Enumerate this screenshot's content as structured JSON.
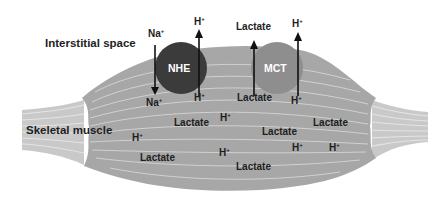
{
  "diagram": {
    "title_regions": {
      "interstitial": "Interstitial space",
      "muscle": "Skeletal muscle"
    },
    "transporters": [
      {
        "id": "nhe",
        "label": "NHE",
        "color": "#3b3b3b",
        "in_label": "Na",
        "in_sup": "+",
        "out_label": "H",
        "out_sup": "+",
        "direction": "Na+ into cell, H+ out of cell"
      },
      {
        "id": "mct",
        "label": "MCT",
        "color": "#8e8e8e",
        "out1_label": "Lactate",
        "out2_label": "H",
        "out2_sup": "+",
        "direction": "Lactate and H+ out of cell"
      }
    ],
    "outside_labels": {
      "na_top": "Na",
      "na_top_sup": "+",
      "h_top_nhe": "H",
      "h_top_nhe_sup": "+",
      "lactate_top": "Lactate",
      "h_top_mct": "H",
      "h_top_mct_sup": "+"
    },
    "inside_labels": [
      {
        "text": "Na",
        "sup": "+"
      },
      {
        "text": "H",
        "sup": "+"
      },
      {
        "text": "Lactate",
        "sup": ""
      },
      {
        "text": "H",
        "sup": "+"
      },
      {
        "text": "Lactate",
        "sup": ""
      },
      {
        "text": "H",
        "sup": "+"
      },
      {
        "text": "Lactate",
        "sup": ""
      },
      {
        "text": "Lactate",
        "sup": ""
      },
      {
        "text": "H",
        "sup": "+"
      },
      {
        "text": "H",
        "sup": "+"
      },
      {
        "text": "H",
        "sup": "+"
      },
      {
        "text": "H",
        "sup": "+"
      },
      {
        "text": "Lactate",
        "sup": ""
      },
      {
        "text": "Lactate",
        "sup": ""
      }
    ],
    "colors": {
      "muscle": "#a7a7a7",
      "tendon": "#c9c9c9",
      "fiber_lines": "#d8d8d8",
      "text": "#1e1e1e",
      "arrow": "#111111"
    }
  }
}
